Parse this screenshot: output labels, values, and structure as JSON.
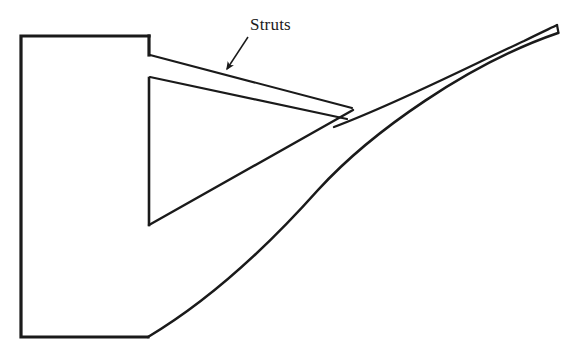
{
  "figure": {
    "kind": "engineering-line-drawing",
    "background_color": "#ffffff",
    "line_color": "#1a1a1a",
    "width": 576,
    "height": 355
  },
  "annotations": {
    "strut_label": {
      "text": "Struts",
      "x": 250,
      "y": 30,
      "font_size": 17
    },
    "leader_line": {
      "from_x": 247,
      "from_y": 36,
      "to_x": 224,
      "to_y": 71,
      "arrowhead": "filled-triangle"
    }
  },
  "geometry": {
    "hub_block": {
      "name": "hub-block",
      "left": 21,
      "top": 36,
      "right": 149,
      "bottom": 337,
      "stroke_width": 3
    },
    "strut_upper_edge": {
      "name": "strut-upper-edge",
      "x1": 150,
      "y1": 55,
      "x2": 352,
      "y2": 108
    },
    "strut_lower_edge": {
      "name": "strut-lower-edge",
      "x1": 150,
      "y1": 77,
      "x2": 346,
      "y2": 119
    },
    "strut_web_vertical": {
      "name": "strut-web-vertical",
      "x1": 149,
      "y1": 78,
      "x2": 149,
      "y2": 225
    },
    "strut_web_diagonal": {
      "name": "strut-web-diagonal",
      "x1": 149,
      "y1": 225,
      "x2": 352,
      "y2": 110
    },
    "nozzle_upper_curve": {
      "name": "nozzle-upper-curve",
      "start_x": 334,
      "start_y": 125,
      "c1_x": 420,
      "c1_y": 92,
      "c2_x": 495,
      "c2_y": 52,
      "end_x": 557,
      "end_y": 25
    },
    "nozzle_lower_curve": {
      "name": "nozzle-lower-curve",
      "start_x": 148,
      "start_y": 337,
      "c1_x": 235,
      "c1_y": 285,
      "c2_x": 330,
      "c2_y": 180,
      "end_x": 420,
      "end_y": 112,
      "c3_x": 480,
      "c3_y": 66,
      "c4_x": 530,
      "c4_y": 40,
      "tip_x": 558,
      "tip_y": 33
    },
    "nozzle_tip_cap": {
      "name": "nozzle-tip-cap",
      "x1": 557,
      "y1": 25,
      "x2": 558,
      "y2": 33
    }
  }
}
